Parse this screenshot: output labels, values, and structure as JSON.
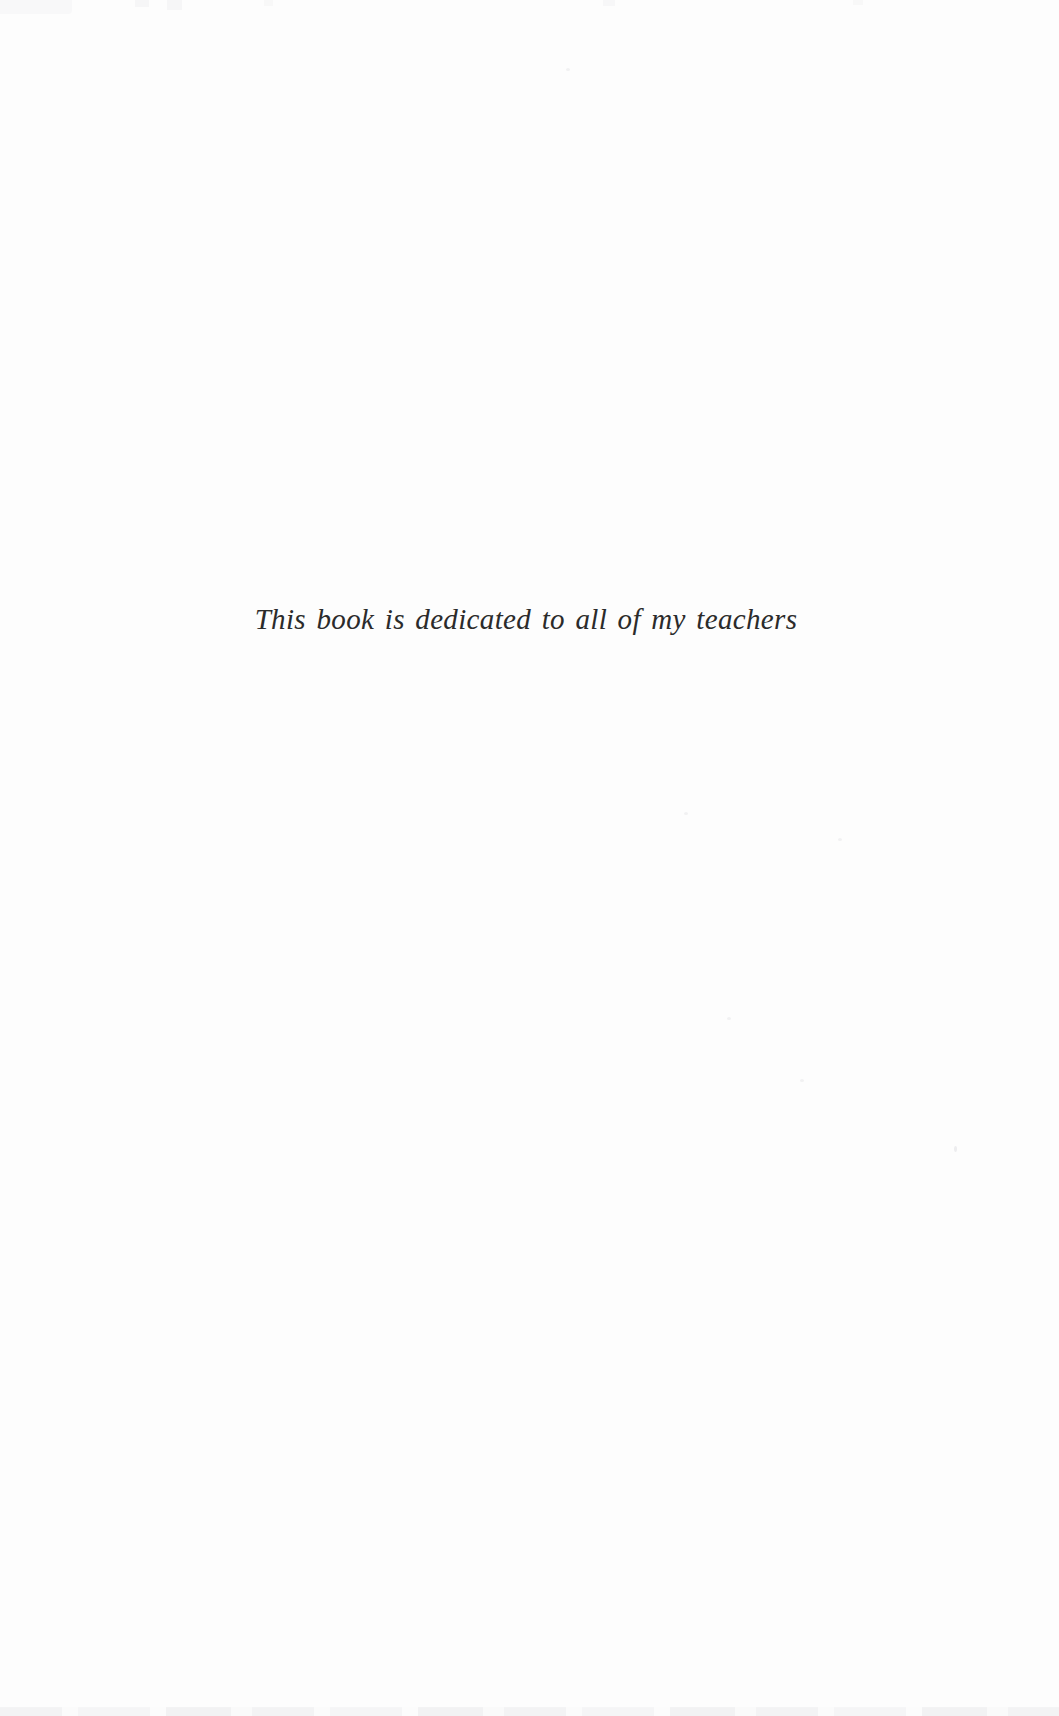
{
  "page": {
    "kind": "book-dedication-page",
    "dedication_text": "This book is dedicated to all of my teachers",
    "text_color": "#2b2b2b",
    "background_color": "#fdfdfd"
  }
}
